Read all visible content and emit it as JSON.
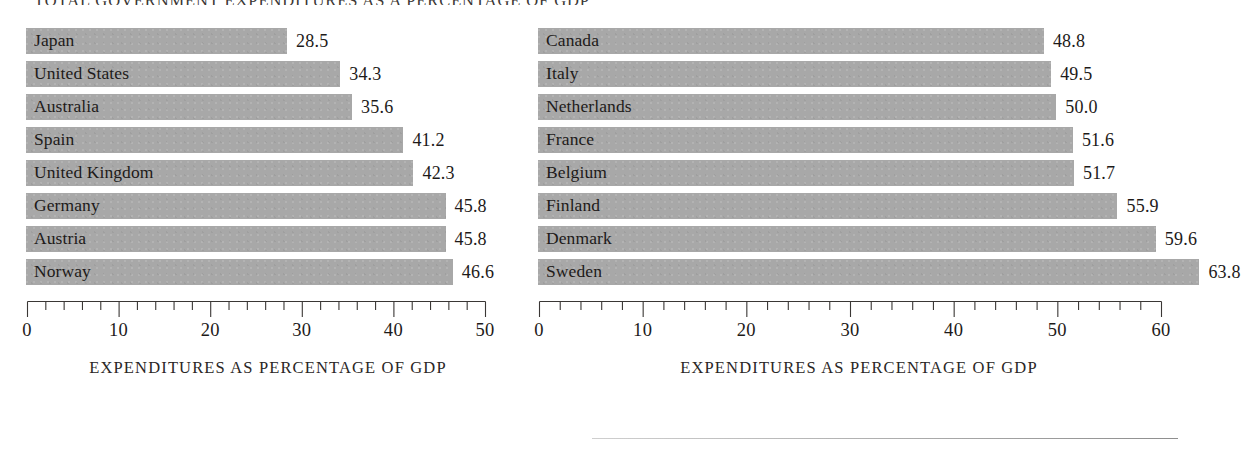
{
  "figure": {
    "title": "TOTAL GOVERNMENT EXPENDITURES AS A PERCENTAGE OF GDP",
    "bar_color": "#a8a8a8",
    "text_color": "#1d1a19"
  },
  "chart_data": [
    {
      "type": "bar",
      "orientation": "horizontal",
      "id": "left-panel",
      "title": "",
      "xlabel": "EXPENDITURES AS PERCENTAGE OF GDP",
      "ylabel": "",
      "xlim": [
        0,
        50
      ],
      "xticks": [
        0,
        10,
        20,
        30,
        40,
        50
      ],
      "xtick_labels": [
        "0",
        "10",
        "20",
        "30",
        "40",
        "50"
      ],
      "minor_tick_step": 2,
      "grid": false,
      "legend": "none",
      "categories": [
        "Japan",
        "United States",
        "Australia",
        "Spain",
        "United Kingdom",
        "Germany",
        "Austria",
        "Norway"
      ],
      "values": [
        28.5,
        34.3,
        35.6,
        41.2,
        42.3,
        45.8,
        45.8,
        46.6
      ],
      "value_labels": [
        "28.5",
        "34.3",
        "35.6",
        "41.2",
        "42.3",
        "45.8",
        "45.8",
        "46.6"
      ]
    },
    {
      "type": "bar",
      "orientation": "horizontal",
      "id": "right-panel",
      "title": "",
      "xlabel": "EXPENDITURES AS PERCENTAGE OF GDP",
      "ylabel": "",
      "xlim": [
        0,
        60
      ],
      "xticks": [
        0,
        10,
        20,
        30,
        40,
        50,
        60
      ],
      "xtick_labels": [
        "0",
        "10",
        "20",
        "30",
        "40",
        "50",
        "60"
      ],
      "minor_tick_step": 2,
      "grid": false,
      "legend": "none",
      "categories": [
        "Canada",
        "Italy",
        "Netherlands",
        "France",
        "Belgium",
        "Finland",
        "Denmark",
        "Sweden"
      ],
      "values": [
        48.8,
        49.5,
        50.0,
        51.6,
        51.7,
        55.9,
        59.6,
        63.8
      ],
      "value_labels": [
        "48.8",
        "49.5",
        "50.0",
        "51.6",
        "51.7",
        "55.9",
        "59.6",
        "63.8"
      ]
    }
  ]
}
